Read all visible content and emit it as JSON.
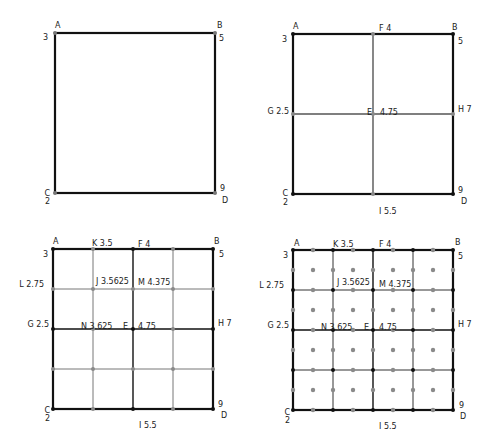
{
  "diagram": {
    "colors": {
      "major_line": "#111111",
      "minor_line": "#777777",
      "corner_point": "#777777",
      "grid_point_black": "#111111",
      "grid_point_gray": "#8a8a8a",
      "label": "#222222"
    },
    "panels": [
      {
        "id": "step1",
        "box": {
          "x": 55,
          "y": 33,
          "size": 160
        },
        "subdivisions": 1,
        "labels": [
          {
            "text": "A",
            "x": 55,
            "y": 28,
            "anchor": "start"
          },
          {
            "text": "3",
            "x": 48,
            "y": 40,
            "anchor": "end"
          },
          {
            "text": "B",
            "x": 217,
            "y": 28,
            "anchor": "start"
          },
          {
            "text": "5",
            "x": 219,
            "y": 41,
            "anchor": "start"
          },
          {
            "text": "C",
            "x": 50,
            "y": 196,
            "anchor": "end"
          },
          {
            "text": "2",
            "x": 50,
            "y": 204,
            "anchor": "end"
          },
          {
            "text": "9",
            "x": 220,
            "y": 191,
            "anchor": "start"
          },
          {
            "text": "D",
            "x": 222,
            "y": 203,
            "anchor": "start"
          }
        ]
      },
      {
        "id": "step2",
        "box": {
          "x": 293,
          "y": 34,
          "size": 160
        },
        "subdivisions": 2,
        "labels": [
          {
            "text": "A",
            "x": 293,
            "y": 29,
            "anchor": "start"
          },
          {
            "text": "3",
            "x": 287,
            "y": 42,
            "anchor": "end"
          },
          {
            "text": "F 4",
            "x": 379,
            "y": 31,
            "anchor": "start"
          },
          {
            "text": "B",
            "x": 452,
            "y": 30,
            "anchor": "start"
          },
          {
            "text": "5",
            "x": 458,
            "y": 44,
            "anchor": "start"
          },
          {
            "text": "G 2.5",
            "x": 289,
            "y": 114,
            "anchor": "end"
          },
          {
            "text": "E",
            "x": 367,
            "y": 115,
            "anchor": "start"
          },
          {
            "text": "4.75",
            "x": 380,
            "y": 115,
            "anchor": "start"
          },
          {
            "text": "H 7",
            "x": 458,
            "y": 112,
            "anchor": "start"
          },
          {
            "text": "C",
            "x": 288,
            "y": 196,
            "anchor": "end"
          },
          {
            "text": "2",
            "x": 288,
            "y": 205,
            "anchor": "end"
          },
          {
            "text": "9",
            "x": 458,
            "y": 193,
            "anchor": "start"
          },
          {
            "text": "D",
            "x": 461,
            "y": 204,
            "anchor": "start"
          },
          {
            "text": "I 5.5",
            "x": 379,
            "y": 214,
            "anchor": "start"
          }
        ]
      },
      {
        "id": "step3",
        "box": {
          "x": 53,
          "y": 249,
          "size": 160
        },
        "subdivisions": 4,
        "labels": [
          {
            "text": "A",
            "x": 53,
            "y": 244,
            "anchor": "start"
          },
          {
            "text": "3",
            "x": 48,
            "y": 257,
            "anchor": "end"
          },
          {
            "text": "K 3.5",
            "x": 92,
            "y": 246,
            "anchor": "start"
          },
          {
            "text": "F 4",
            "x": 138,
            "y": 247,
            "anchor": "start"
          },
          {
            "text": "B",
            "x": 214,
            "y": 244,
            "anchor": "start"
          },
          {
            "text": "5",
            "x": 219,
            "y": 257,
            "anchor": "start"
          },
          {
            "text": "L 2.75",
            "x": 44,
            "y": 287,
            "anchor": "end"
          },
          {
            "text": "J 3.5625",
            "x": 96,
            "y": 284,
            "anchor": "start"
          },
          {
            "text": "M 4.375",
            "x": 138,
            "y": 285,
            "anchor": "start"
          },
          {
            "text": "G 2.5",
            "x": 49,
            "y": 327,
            "anchor": "end"
          },
          {
            "text": "N 3.625",
            "x": 81,
            "y": 329,
            "anchor": "start"
          },
          {
            "text": "E",
            "x": 123,
            "y": 329,
            "anchor": "start"
          },
          {
            "text": "4.75",
            "x": 138,
            "y": 329,
            "anchor": "start"
          },
          {
            "text": "H 7",
            "x": 218,
            "y": 326,
            "anchor": "start"
          },
          {
            "text": "C",
            "x": 50,
            "y": 413,
            "anchor": "end"
          },
          {
            "text": "2",
            "x": 50,
            "y": 421,
            "anchor": "end"
          },
          {
            "text": "9",
            "x": 218,
            "y": 407,
            "anchor": "start"
          },
          {
            "text": "D",
            "x": 221,
            "y": 418,
            "anchor": "start"
          },
          {
            "text": "I 5.5",
            "x": 139,
            "y": 428,
            "anchor": "start"
          }
        ]
      },
      {
        "id": "step4",
        "box": {
          "x": 293,
          "y": 250,
          "size": 160
        },
        "subdivisions": 4,
        "lattice": 8,
        "labels": [
          {
            "text": "A",
            "x": 294,
            "y": 246,
            "anchor": "start"
          },
          {
            "text": "3",
            "x": 288,
            "y": 258,
            "anchor": "end"
          },
          {
            "text": "K 3.5",
            "x": 333,
            "y": 247,
            "anchor": "start"
          },
          {
            "text": "F 4",
            "x": 379,
            "y": 247,
            "anchor": "start"
          },
          {
            "text": "B",
            "x": 455,
            "y": 245,
            "anchor": "start"
          },
          {
            "text": "5",
            "x": 458,
            "y": 259,
            "anchor": "start"
          },
          {
            "text": "L 2.75",
            "x": 284,
            "y": 288,
            "anchor": "end"
          },
          {
            "text": "J 3.5625",
            "x": 337,
            "y": 285,
            "anchor": "start"
          },
          {
            "text": "M 4.375",
            "x": 379,
            "y": 287,
            "anchor": "start"
          },
          {
            "text": "G 2.5",
            "x": 289,
            "y": 328,
            "anchor": "end"
          },
          {
            "text": "N 3.625",
            "x": 321,
            "y": 330,
            "anchor": "start"
          },
          {
            "text": "E",
            "x": 364,
            "y": 330,
            "anchor": "start"
          },
          {
            "text": "4.75",
            "x": 379,
            "y": 330,
            "anchor": "start"
          },
          {
            "text": "H 7",
            "x": 458,
            "y": 327,
            "anchor": "start"
          },
          {
            "text": "C",
            "x": 290,
            "y": 415,
            "anchor": "end"
          },
          {
            "text": "2",
            "x": 290,
            "y": 423,
            "anchor": "end"
          },
          {
            "text": "9",
            "x": 459,
            "y": 408,
            "anchor": "start"
          },
          {
            "text": "D",
            "x": 460,
            "y": 419,
            "anchor": "start"
          },
          {
            "text": "I 5.5",
            "x": 379,
            "y": 429,
            "anchor": "start"
          }
        ]
      }
    ]
  }
}
